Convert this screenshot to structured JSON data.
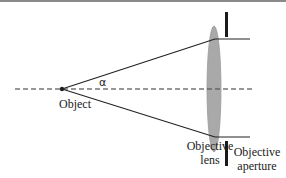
{
  "diagram": {
    "type": "optical-ray-diagram",
    "labels": {
      "angle": "α",
      "object": "Object",
      "lens_line1": "Objective",
      "lens_line2": "lens",
      "aperture_line1": "Objective",
      "aperture_line2": "aperture"
    },
    "elements": {
      "optical_axis": {
        "style": "dashed",
        "color": "#333333"
      },
      "object_point": {
        "color": "#222222"
      },
      "lens": {
        "fill": "#a9a9a9",
        "stroke": "#8f8f8f"
      },
      "rays": {
        "color": "#222222",
        "count": 2
      },
      "aperture_bars": {
        "color": "#1a1a1a",
        "count": 2
      }
    },
    "colors": {
      "background": "#ffffff",
      "top_border": "#8a8a8a",
      "ink": "#1a1a1a"
    }
  }
}
